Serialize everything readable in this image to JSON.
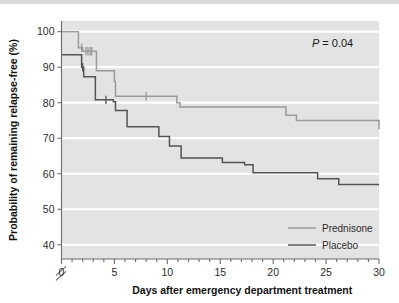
{
  "figure": {
    "background_color": "#ffffff",
    "plot_background_color": "#e3e3e3",
    "gridline_color": "#ffffff"
  },
  "annotations": {
    "p_value_symbol": "P",
    "p_value_text": "= 0.04"
  },
  "legend": {
    "position": "bottom-right",
    "entries": [
      {
        "label": "Prednisone",
        "color": "#9a9a9a"
      },
      {
        "label": "Placebo",
        "color": "#545454"
      }
    ]
  },
  "chart_data": {
    "type": "line",
    "title": "",
    "subtitle": "",
    "xlabel": "Days after emergency department treatment",
    "ylabel": "Probability of remaining relapse-free (%)",
    "xlim": [
      0,
      30
    ],
    "ylim": [
      36,
      103
    ],
    "xticks": [
      0,
      5,
      10,
      15,
      20,
      25,
      30
    ],
    "xtick_labels": [
      "0",
      "5",
      "10",
      "15",
      "20",
      "25",
      "30"
    ],
    "xminor_tick_step": 1,
    "yticks": [
      40,
      50,
      60,
      70,
      80,
      90,
      100
    ],
    "ytick_labels": [
      "40",
      "50",
      "60",
      "70",
      "80",
      "90",
      "100"
    ],
    "y_axis_break": true,
    "y_axis_break_below": 40,
    "grid": "horizontal",
    "legend_position": "bottom-right",
    "step_style": "post",
    "annotation": "P = 0.04",
    "series": [
      {
        "name": "Prednisone",
        "color": "#9a9a9a",
        "x": [
          0,
          1.0,
          1.6,
          2.0,
          3.0,
          3.3,
          4.3,
          5.0,
          5.1,
          9.6,
          10.9,
          11.2,
          20.3,
          21.2,
          22.2,
          30
        ],
        "y": [
          100,
          100,
          95.5,
          94.5,
          94.5,
          89.0,
          89.0,
          86.0,
          81.8,
          81.8,
          80.0,
          78.8,
          78.8,
          76.5,
          75.0,
          72.5
        ],
        "censor_x": [
          1.9,
          2.3,
          2.5,
          2.7,
          2.85,
          8.0
        ],
        "censor_y": [
          95.5,
          94.5,
          94.5,
          94.5,
          94.5,
          81.8
        ]
      },
      {
        "name": "Placebo",
        "color": "#545454",
        "x": [
          0,
          1.0,
          1.9,
          2.1,
          3.0,
          3.2,
          4.5,
          4.9,
          5.1,
          6.0,
          6.2,
          7.0,
          8.9,
          9.2,
          9.9,
          10.2,
          11.0,
          11.3,
          15.0,
          15.2,
          17.0,
          17.3,
          17.9,
          18.1,
          23.9,
          24.2,
          26.0,
          26.2,
          30
        ],
        "y": [
          93.5,
          93.5,
          90.0,
          87.3,
          87.3,
          80.8,
          80.8,
          80.3,
          77.8,
          77.8,
          73.2,
          73.2,
          73.2,
          70.5,
          70.5,
          67.8,
          67.8,
          64.4,
          64.4,
          63.2,
          63.2,
          62.5,
          62.5,
          60.3,
          60.3,
          58.6,
          58.6,
          57.0,
          57.0
        ],
        "censor_x": [
          2.0,
          4.2
        ],
        "censor_y": [
          90.0,
          80.8
        ]
      }
    ]
  }
}
